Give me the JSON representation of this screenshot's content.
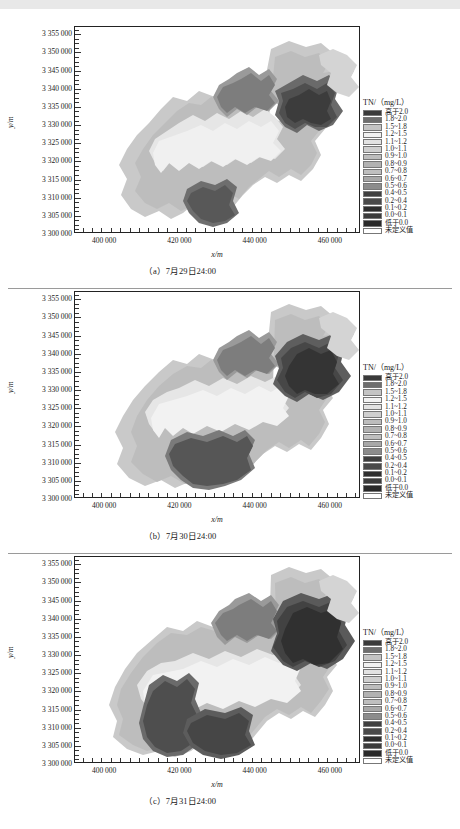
{
  "figure": {
    "axes": {
      "xlabel": "x/m",
      "ylabel": "y/m",
      "xticks": [
        "400 000",
        "420 000",
        "440 000",
        "460 000"
      ],
      "xtick_values": [
        400000,
        420000,
        440000,
        460000
      ],
      "yticks": [
        "3 355 000",
        "3 350 000",
        "3 345 000",
        "3 340 000",
        "3 335 000",
        "3 330 000",
        "3 325 000",
        "3 320 000",
        "3 315 000",
        "3 310 000",
        "3 305 000",
        "3 300 000"
      ],
      "ytick_values": [
        3355000,
        3350000,
        3345000,
        3340000,
        3335000,
        3330000,
        3325000,
        3320000,
        3315000,
        3310000,
        3305000,
        3300000
      ],
      "xlim": [
        392000,
        468000
      ],
      "ylim": [
        3300000,
        3357000
      ]
    },
    "legend": {
      "title": "TN/（mg/L）",
      "entries": [
        {
          "label": "高于2.0",
          "color": "#3a3a3a"
        },
        {
          "label": "1.8~2.0",
          "color": "#6e6e6e"
        },
        {
          "label": "1.5~1.8",
          "color": "#c4c4c4"
        },
        {
          "label": "1.2~1.5",
          "color": "#f2f2f2"
        },
        {
          "label": "1.1~1.2",
          "color": "#e2e2e2"
        },
        {
          "label": "1.0~1.1",
          "color": "#cfcfcf"
        },
        {
          "label": "0.9~1.0",
          "color": "#bdbdbd"
        },
        {
          "label": "0.8~0.9",
          "color": "#b2b2b2"
        },
        {
          "label": "0.7~0.8",
          "color": "#bfbfbf"
        },
        {
          "label": "0.6~0.7",
          "color": "#a8a8a8"
        },
        {
          "label": "0.5~0.6",
          "color": "#8c8c8c"
        },
        {
          "label": "0.4~0.5",
          "color": "#3f3f3f"
        },
        {
          "label": "0.2~0.4",
          "color": "#4a4a4a"
        },
        {
          "label": "0.1~0.2",
          "color": "#2e2e2e"
        },
        {
          "label": "0.0~0.1",
          "color": "#3c3c3c"
        },
        {
          "label": "低于0.0",
          "color": "#2a2a2a"
        },
        {
          "label": "未定义值",
          "color": "#ffffff"
        }
      ]
    },
    "panels": [
      {
        "id": "a",
        "caption": "（a）7月29日24:00"
      },
      {
        "id": "b",
        "caption": "（b）7月30日24:00"
      },
      {
        "id": "c",
        "caption": "（c）7月31日24:00"
      }
    ]
  },
  "chart_data": {
    "type": "heatmap",
    "title": "",
    "xlabel": "x/m",
    "ylabel": "y/m",
    "xlim": [
      392000,
      468000
    ],
    "ylim": [
      3300000,
      3357000
    ],
    "grid": false,
    "legend_position": "right",
    "variable": "TN",
    "unit": "mg/L",
    "class_breaks": [
      0.0,
      0.1,
      0.2,
      0.4,
      0.5,
      0.6,
      0.7,
      0.8,
      0.9,
      1.0,
      1.1,
      1.2,
      1.5,
      1.8,
      2.0
    ],
    "class_labels": [
      "低于0.0",
      "0.0~0.1",
      "0.1~0.2",
      "0.2~0.4",
      "0.4~0.5",
      "0.5~0.6",
      "0.6~0.7",
      "0.7~0.8",
      "0.8~0.9",
      "0.9~1.0",
      "1.0~1.1",
      "1.1~1.2",
      "1.2~1.5",
      "1.5~1.8",
      "1.8~2.0",
      "高于2.0",
      "未定义值"
    ],
    "series": [
      {
        "name": "（a）7月29日24:00",
        "description": "TN 浓度分布，西南—东北向羽状分布，东北端与中部存在高值(>2.0)核心区"
      },
      {
        "name": "（b）7月30日24:00",
        "description": "TN 浓度分布，西南部高值核心区扩大并向东延伸"
      },
      {
        "name": "（c）7月31日24:00",
        "description": "TN 浓度分布，西南与东北高值区进一步扩展合并"
      }
    ]
  }
}
